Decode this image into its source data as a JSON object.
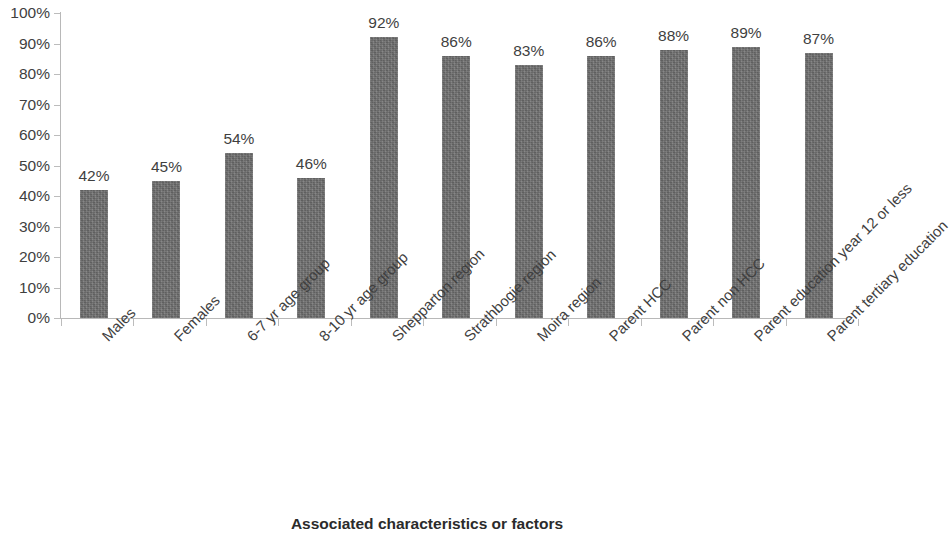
{
  "chart_data": {
    "type": "bar",
    "title": "",
    "xlabel": "Associated characteristics or factors",
    "ylabel": "",
    "ylim": [
      0,
      100
    ],
    "grid": false,
    "legend": "none",
    "y_ticks": [
      "0%",
      "10%",
      "20%",
      "30%",
      "40%",
      "50%",
      "60%",
      "70%",
      "80%",
      "90%",
      "100%"
    ],
    "y_tick_values": [
      0,
      10,
      20,
      30,
      40,
      50,
      60,
      70,
      80,
      90,
      100
    ],
    "categories": [
      "Males",
      "Females",
      "6-7 yr age group",
      "8-10 yr age group",
      "Shepparton region",
      "Strathbogie region",
      "Moira region",
      "Parent HCC",
      "Parent non HCC",
      "Parent education year 12 or less",
      "Parent tertiary education"
    ],
    "values": [
      42,
      45,
      54,
      46,
      92,
      86,
      83,
      86,
      88,
      89,
      87
    ],
    "data_labels": [
      "42%",
      "45%",
      "54%",
      "46%",
      "92%",
      "86%",
      "83%",
      "86%",
      "88%",
      "89%",
      "87%"
    ],
    "bar_color": "#6e6e6e",
    "axis_color": "#b8b8b8",
    "text_color": "#3f3f3f",
    "background_color": "#ffffff"
  }
}
